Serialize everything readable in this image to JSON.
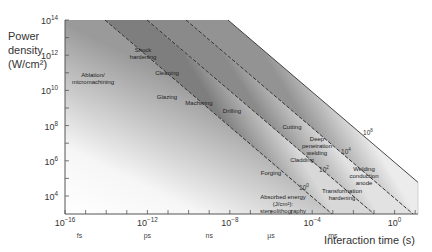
{
  "chart_data": {
    "type": "area",
    "title": "",
    "ylabel_lines": [
      "Power",
      "density",
      "(W/cm²)"
    ],
    "xlabel": "Interaction time (s)",
    "x_scale": "log",
    "y_scale": "log",
    "xlim_exp": [
      -16,
      1
    ],
    "ylim_exp": [
      3,
      14
    ],
    "x_ticks": [
      {
        "exp": -16,
        "label": "10",
        "sup": "−16"
      },
      {
        "exp": -12,
        "label": "10",
        "sup": "−12"
      },
      {
        "exp": -8,
        "label": "10",
        "sup": "−8"
      },
      {
        "exp": -4,
        "label": "10",
        "sup": "−4"
      },
      {
        "exp": 0,
        "label": "10",
        "sup": "0"
      }
    ],
    "y_ticks": [
      {
        "exp": 14,
        "label": "10",
        "sup": "14"
      },
      {
        "exp": 12,
        "label": "10",
        "sup": "12"
      },
      {
        "exp": 10,
        "label": "10",
        "sup": "10"
      },
      {
        "exp": 8,
        "label": "10",
        "sup": "8"
      },
      {
        "exp": 6,
        "label": "10",
        "sup": "6"
      },
      {
        "exp": 4,
        "label": "10",
        "sup": "4"
      }
    ],
    "time_units": [
      {
        "label": "fs",
        "exp": -15
      },
      {
        "label": "ps",
        "exp": -12
      },
      {
        "label": "ns",
        "exp": -9
      },
      {
        "label": "µs",
        "exp": -6
      },
      {
        "label": "ms",
        "exp": -3
      }
    ],
    "energy_lines": [
      {
        "label": "10",
        "sup": "0",
        "energy_exp": 0
      },
      {
        "label": "10",
        "sup": "2",
        "energy_exp": 2
      },
      {
        "label": "10",
        "sup": "4",
        "energy_exp": 4
      },
      {
        "label": "10",
        "sup": "8",
        "energy_exp": 8
      }
    ],
    "energy_line_caption": [
      "Absorbed energy",
      "(J/cm²):",
      "stereolithography"
    ],
    "processes": [
      {
        "lines": [
          "Ablation/",
          "micromachining"
        ],
        "x": 93,
        "y": 77
      },
      {
        "lines": [
          "Shock",
          "hardening"
        ],
        "x": 143,
        "y": 52
      },
      {
        "lines": [
          "Cleaning"
        ],
        "x": 167,
        "y": 75
      },
      {
        "lines": [
          "Glazing"
        ],
        "x": 167,
        "y": 99
      },
      {
        "lines": [
          "Machining"
        ],
        "x": 199,
        "y": 105
      },
      {
        "lines": [
          "Drilling"
        ],
        "x": 232,
        "y": 113
      },
      {
        "lines": [
          "Cutting"
        ],
        "x": 292,
        "y": 129
      },
      {
        "lines": [
          "Deep",
          "penetration",
          "welding"
        ],
        "x": 317,
        "y": 141
      },
      {
        "lines": [
          "Cladding"
        ],
        "x": 302,
        "y": 162
      },
      {
        "lines": [
          "Forging"
        ],
        "x": 271,
        "y": 175
      },
      {
        "lines": [
          "Welding",
          "conduction",
          "anode"
        ],
        "x": 364,
        "y": 171
      },
      {
        "lines": [
          "Transformation",
          "hardening"
        ],
        "x": 342,
        "y": 193
      }
    ]
  }
}
